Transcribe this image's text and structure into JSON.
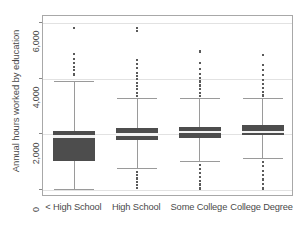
{
  "chart_data": {
    "type": "box",
    "title": "",
    "xlabel": "",
    "ylabel": "Annual hours worked by education",
    "ylim": [
      -250,
      6250
    ],
    "yticks": [
      0,
      2000,
      4000,
      6000
    ],
    "ytick_labels": [
      "0",
      "2,000",
      "4,000",
      "6,000"
    ],
    "grid": "horizontal",
    "legend": "none",
    "categories": [
      "< High School",
      "High School",
      "Some College",
      "College Degree"
    ],
    "boxes": [
      {
        "category": "< High School",
        "lower_whisker": 50,
        "q1": 1060,
        "median": 1925,
        "q3": 2120,
        "upper_whisker": 3900,
        "outliers": [
          4150,
          4300,
          4420,
          4560,
          4700,
          4880,
          5820
        ]
      },
      {
        "category": "High School",
        "lower_whisker": 790,
        "q1": 1790,
        "median": 2000,
        "q3": 2220,
        "upper_whisker": 3300,
        "outliers": [
          3380,
          3500,
          3620,
          3740,
          3860,
          3980,
          4100,
          4220,
          4380,
          4520,
          4680,
          5720,
          5820
        ],
        "low_outliers": [
          80,
          180,
          300,
          420,
          540,
          660
        ]
      },
      {
        "category": "Some College",
        "lower_whisker": 1050,
        "q1": 1880,
        "median": 2080,
        "q3": 2280,
        "upper_whisker": 3300,
        "outliers": [
          3380,
          3500,
          3620,
          3760,
          3900,
          4020,
          4180,
          4360,
          4560,
          4980
        ],
        "low_outliers": [
          60,
          200,
          340,
          480,
          620,
          760,
          900
        ]
      },
      {
        "category": "College Degree",
        "lower_whisker": 1160,
        "q1": 1960,
        "median": 2075,
        "q3": 2330,
        "upper_whisker": 3300,
        "outliers": [
          3400,
          3520,
          3660,
          3800,
          3960,
          4120,
          4300,
          4480,
          4840
        ],
        "low_outliers": [
          60,
          220,
          380,
          540,
          700,
          860,
          1000
        ]
      }
    ]
  },
  "axes": {
    "y_title": "Annual hours worked by education",
    "y_tick_labels": [
      "6,000",
      "4,000",
      "2,000",
      "0"
    ],
    "x_tick_labels": [
      "< High School",
      "High School",
      "Some College",
      "College Degree"
    ]
  }
}
